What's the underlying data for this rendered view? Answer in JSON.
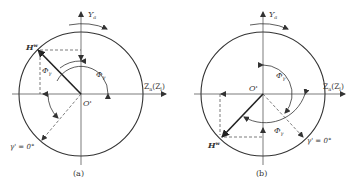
{
  "figure": {
    "panels": [
      {
        "id": "a",
        "caption": "(a)",
        "axis_y_label": "Y",
        "axis_y_sub": "a",
        "axis_z_label": "Z",
        "axis_z_sub": "a",
        "axis_z_paren": "(Z",
        "axis_z_paren_sub": "l",
        "axis_z_close": ")",
        "origin_label": "O'",
        "vector_label": "H",
        "vector_sup": "w",
        "phi_gamma_label": "Φ",
        "phi_gamma_sub": "γ",
        "phi_gamma2_label": "Φ",
        "phi_gamma2_sub": "γ",
        "zero_label": "γ' = 0°"
      },
      {
        "id": "b",
        "caption": "(b)",
        "axis_y_label": "Y",
        "axis_y_sub": "a",
        "axis_z_label": "Z",
        "axis_z_sub": "a",
        "axis_z_paren": "(Z",
        "axis_z_paren_sub": "l",
        "axis_z_close": ")",
        "origin_label": "O'",
        "vector_label": "H",
        "vector_sup": "w",
        "phi_gamma_label": "Φ",
        "phi_gamma_sub": "γ",
        "phi_gamma2_label": "Φ",
        "phi_gamma2_sub": "γ",
        "zero_label": "γ' = 0°"
      }
    ],
    "colors": {
      "stroke": "#333333",
      "background": "#ffffff"
    }
  }
}
